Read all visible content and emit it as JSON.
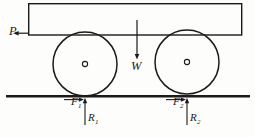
{
  "figure": {
    "background_color": "#fdfdfb",
    "line_color": "#1a1a1a",
    "body": {
      "shape": "rectangle",
      "x": 28,
      "y": 3,
      "width": 214,
      "height": 32,
      "stroke_width": 1.4
    },
    "ground": {
      "x1": 6,
      "y1": 96,
      "x2": 250,
      "y2": 96,
      "stroke_width": 2.6
    },
    "wheels": [
      {
        "name": "front-wheel",
        "cx": 85,
        "cy": 64,
        "r": 32,
        "hub_r": 2.6,
        "stroke_width": 1.5
      },
      {
        "name": "rear-wheel",
        "cx": 187,
        "cy": 62,
        "r": 32,
        "hub_r": 2.6,
        "stroke_width": 1.5
      }
    ],
    "forces": [
      {
        "id": "P",
        "label": "P",
        "subscript": "",
        "direction": "left",
        "description": "applied pull force on cart body",
        "tail_x": 28,
        "tail_y": 33,
        "head_x": 14,
        "head_y": 33
      },
      {
        "id": "W",
        "label": "W",
        "subscript": "",
        "direction": "down",
        "description": "weight of cart acting downward",
        "tail_x": 137,
        "tail_y": 20,
        "head_x": 137,
        "head_y": 58
      },
      {
        "id": "F1",
        "label": "F",
        "subscript": "1",
        "direction": "right",
        "description": "friction force at front wheel contact",
        "tail_x": 64,
        "tail_y": 99,
        "head_x": 84,
        "head_y": 99
      },
      {
        "id": "F2",
        "label": "F",
        "subscript": "2",
        "direction": "right",
        "description": "friction force at rear wheel contact",
        "tail_x": 166,
        "tail_y": 99,
        "head_x": 186,
        "head_y": 99
      },
      {
        "id": "R1",
        "label": "R",
        "subscript": "1",
        "direction": "up",
        "description": "normal reaction at front wheel",
        "tail_x": 85,
        "tail_y": 124,
        "head_x": 85,
        "head_y": 98
      },
      {
        "id": "R2",
        "label": "R",
        "subscript": "2",
        "direction": "up",
        "description": "normal reaction at rear wheel",
        "tail_x": 187,
        "tail_y": 124,
        "head_x": 187,
        "head_y": 98
      }
    ]
  },
  "labels": {
    "P": "P",
    "W": "W",
    "F": "F",
    "R": "R",
    "one": "1",
    "two": "2"
  }
}
